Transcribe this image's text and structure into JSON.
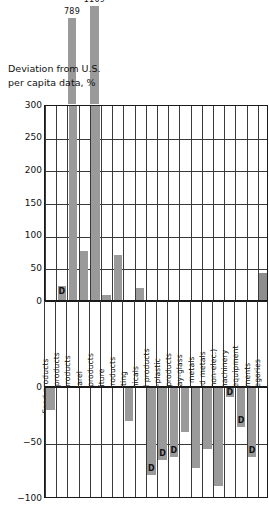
{
  "chart_data": {
    "type": "bar",
    "title": "Deviation from U.S. per capita data, %",
    "title_line1": "Deviation from U.S.",
    "title_line2": "per capita data, %",
    "xlabel": "",
    "ylabel": "Deviation from U.S. per capita data, %",
    "axis_break": true,
    "upper_ylim": [
      0,
      300
    ],
    "lower_ylim": [
      -100,
      0
    ],
    "upper_ticks": [
      300,
      250,
      200,
      150,
      100,
      50,
      0
    ],
    "lower_ticks": [
      0,
      -50,
      -100
    ],
    "grid": true,
    "legend": "none",
    "withheld_marker": "D",
    "withheld_note": "D = data withheld",
    "categories": [
      "Food products",
      "Tobacco products",
      "Textile products",
      "Apparel",
      "Lumber products",
      "Furniture",
      "Paper products",
      "Printing",
      "Chemicals",
      "Petro-coal products",
      "Rubber-plastic",
      "Leather products",
      "Stone-clay-glass",
      "Primary metals",
      "Fabricated metals",
      "Machin. (non-elec.)",
      "Electric machinery",
      "Transport equipment",
      "Instruments",
      "All Categories"
    ],
    "values": [
      -20,
      25,
      789,
      78,
      1109,
      10,
      72,
      -30,
      22,
      -78,
      -65,
      -62,
      -40,
      -72,
      -55,
      -88,
      -8,
      -35,
      -62,
      45
    ],
    "withheld": [
      false,
      true,
      false,
      false,
      false,
      false,
      false,
      false,
      false,
      true,
      true,
      true,
      false,
      false,
      false,
      false,
      true,
      true,
      true,
      false
    ],
    "offscale": [
      false,
      false,
      true,
      false,
      true,
      false,
      false,
      false,
      false,
      false,
      false,
      false,
      false,
      false,
      false,
      false,
      false,
      false,
      false,
      false
    ],
    "offscale_labels": {
      "Textile products": "789",
      "Lumber products": "1109"
    },
    "colors": {
      "bar": "#9a9a9a",
      "total_bar": "#8d8d8d",
      "axis": "#1a1a1a",
      "grid": "#3a3a3a",
      "text": "#111111",
      "background": "#ffffff"
    }
  }
}
